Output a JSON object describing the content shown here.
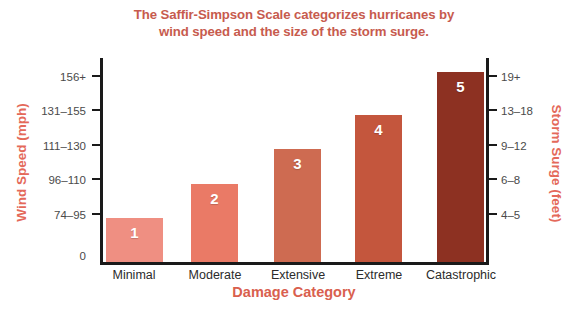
{
  "chart_data": {
    "type": "bar",
    "title": "The Saffir-Simpson Scale categorizes hurricanes by wind speed and the size of the storm surge.",
    "title_line1": "The Saffir-Simpson Scale categorizes hurricanes by",
    "title_line2": "wind speed and the size of the storm surge.",
    "xlabel": "Damage Category",
    "ylabel": "Wind Speed (mph)",
    "ylabel_right": "Storm Surge (feet)",
    "grid": false,
    "legend": "none",
    "categories": [
      "Minimal",
      "Moderate",
      "Extensive",
      "Extreme",
      "Catastrophic"
    ],
    "values": [
      1,
      2,
      3,
      4,
      5
    ],
    "bar_labels": [
      "1",
      "2",
      "3",
      "4",
      "5"
    ],
    "y_tick_labels_left": [
      "156+",
      "131–155",
      "111–130",
      "96–110",
      "74–95",
      "0"
    ],
    "y_tick_labels_right": [
      "19+",
      "13–18",
      "9–12",
      "6–8",
      "4–5"
    ],
    "wind_speed_mph": [
      "74–95",
      "96–110",
      "111–130",
      "131–155",
      "156+"
    ],
    "storm_surge_feet": [
      "4–5",
      "6–8",
      "9–12",
      "13–18",
      "19+"
    ],
    "bar_colors": [
      "#ef8f82",
      "#ea7a66",
      "#ce6b51",
      "#c4563d",
      "#8d3122"
    ],
    "title_color": "#c75b4e",
    "axis_label_color": "#e4695a"
  },
  "bars": [
    {
      "category": "Minimal",
      "label": "1",
      "color": "#ef8f82",
      "left": 106,
      "width": 57,
      "height": 44,
      "label_x": 134
    },
    {
      "category": "Moderate",
      "label": "2",
      "color": "#ea7a66",
      "left": 191,
      "width": 47,
      "height": 78,
      "label_x": 215
    },
    {
      "category": "Extensive",
      "label": "3",
      "color": "#ce6b51",
      "left": 274,
      "width": 47,
      "height": 113,
      "label_x": 298
    },
    {
      "category": "Extreme",
      "label": "4",
      "color": "#c4563d",
      "left": 355,
      "width": 47,
      "height": 147,
      "label_x": 379
    },
    {
      "category": "Catastrophic",
      "label": "5",
      "color": "#8d3122",
      "left": 437,
      "width": 47,
      "height": 190,
      "label_x": 461
    }
  ],
  "ticks_left": [
    {
      "label": "156+",
      "y": 71
    },
    {
      "label": "131–155",
      "y": 105
    },
    {
      "label": "111–130",
      "y": 140
    },
    {
      "label": "96–110",
      "y": 174
    },
    {
      "label": "74–95",
      "y": 209
    },
    {
      "label": "0",
      "y": 250
    }
  ],
  "ticks_right": [
    {
      "label": "19+",
      "y": 71
    },
    {
      "label": "13–18",
      "y": 105
    },
    {
      "label": "9–12",
      "y": 140
    },
    {
      "label": "6–8",
      "y": 174
    },
    {
      "label": "4–5",
      "y": 209
    }
  ]
}
